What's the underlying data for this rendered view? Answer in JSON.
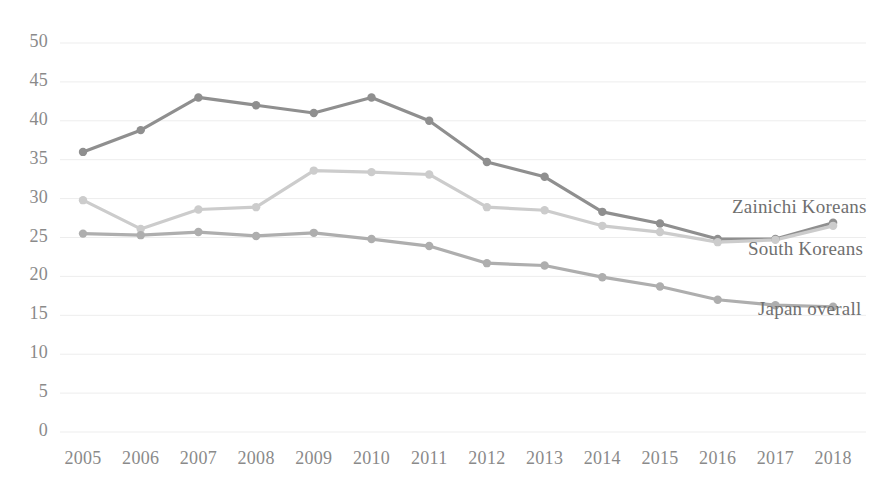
{
  "chart_data": {
    "type": "line",
    "title": "",
    "subtitle": "",
    "xlabel": "",
    "ylabel": "",
    "grid": true,
    "legend_position": "right-inline-labels",
    "categories": [
      "2005",
      "2006",
      "2007",
      "2008",
      "2009",
      "2010",
      "2011",
      "2012",
      "2013",
      "2014",
      "2015",
      "2016",
      "2017",
      "2018"
    ],
    "xlim": [
      "2005",
      "2018"
    ],
    "ylim": [
      0,
      50
    ],
    "ytick_labels": [
      "50",
      "45",
      "40",
      "35",
      "30",
      "25",
      "20",
      "15",
      "10",
      "5",
      "0"
    ],
    "ytick_values": [
      50,
      45,
      40,
      35,
      30,
      25,
      20,
      15,
      10,
      5,
      0
    ],
    "series": [
      {
        "name": "Zainichi Koreans",
        "color": "#8f8f8f",
        "values": [
          36.0,
          38.8,
          43.0,
          42.0,
          41.0,
          43.0,
          40.0,
          34.7,
          32.8,
          28.3,
          26.8,
          24.8,
          24.8,
          26.9
        ]
      },
      {
        "name": "South Koreans",
        "color": "#cccccc",
        "values": [
          29.8,
          26.1,
          28.6,
          28.9,
          33.6,
          33.4,
          33.1,
          28.9,
          28.5,
          26.5,
          25.7,
          24.4,
          24.7,
          26.5
        ]
      },
      {
        "name": "Japan overall",
        "color": "#aeaeae",
        "values": [
          25.5,
          25.3,
          25.7,
          25.2,
          25.6,
          24.8,
          23.9,
          21.7,
          21.4,
          19.9,
          18.7,
          17.0,
          16.3,
          16.1
        ]
      }
    ]
  },
  "axis": {
    "y_label_color": "#8a8a8a",
    "x_label_color": "#8a8a8a",
    "gridline_color": "#ededed"
  }
}
